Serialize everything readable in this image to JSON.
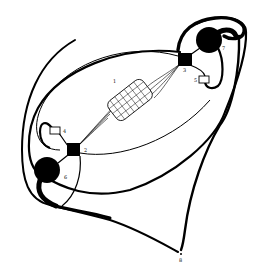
{
  "figure": {
    "type": "schematic line drawing",
    "background": "#ffffff",
    "ink": "#000000",
    "labels": [
      {
        "id": "mesh",
        "text": "1",
        "x": 113,
        "y": 83
      },
      {
        "id": "lower-junction",
        "text": "2",
        "x": 84,
        "y": 152
      },
      {
        "id": "upper-junction",
        "text": "3",
        "x": 183,
        "y": 71
      },
      {
        "id": "lower-chamber",
        "text": "4",
        "x": 64,
        "y": 133
      },
      {
        "id": "upper-chamber",
        "text": "5",
        "x": 194,
        "y": 81
      },
      {
        "id": "lower-bulb",
        "text": "6",
        "x": 64,
        "y": 179
      },
      {
        "id": "upper-bulb",
        "text": "7",
        "x": 222,
        "y": 50
      },
      {
        "id": "apex",
        "text": "8",
        "x": 180,
        "y": 259
      }
    ]
  }
}
